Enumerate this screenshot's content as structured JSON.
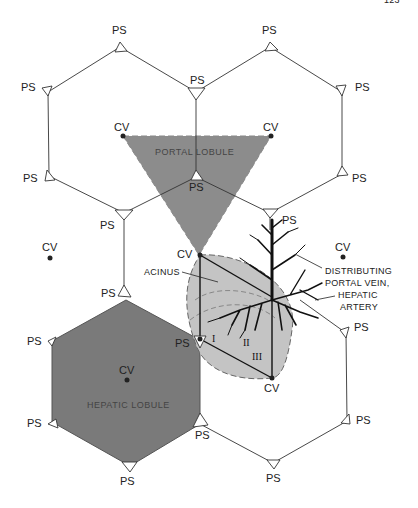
{
  "page_number": "123",
  "labels": {
    "ps": "PS",
    "cv": "CV",
    "portal_lobule": "PORTAL LOBULE",
    "hepatic_lobule": "HEPATIC LOBULE",
    "acinus": "ACINUS",
    "distributing_line1": "DISTRIBUTING",
    "distributing_line2": "PORTAL VEIN,",
    "distributing_line3": "HEPATIC",
    "distributing_line4": "ARTERY",
    "zone1": "I",
    "zone2": "II",
    "zone3": "III"
  },
  "colors": {
    "portal_lobule_fill": "#8c8c8c",
    "hepatic_lobule_fill": "#7a7a7a",
    "acinus_fill": "#c4c4c4",
    "line": "#333333"
  }
}
